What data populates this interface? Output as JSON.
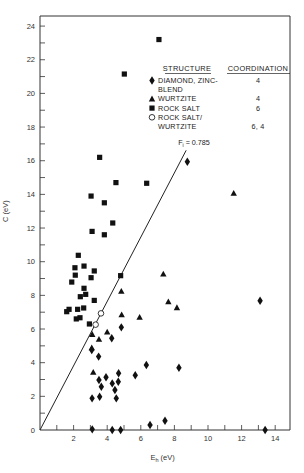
{
  "chart_data": {
    "type": "scatter",
    "title": "",
    "xlabel": "E_h (eV)",
    "ylabel": "C (eV)",
    "xlim": [
      0,
      15
    ],
    "ylim": [
      0,
      24.5
    ],
    "x_ticks": [
      2,
      4,
      6,
      8,
      10,
      12,
      14
    ],
    "x_minor_step": 1,
    "y_ticks": [
      0,
      2,
      4,
      6,
      8,
      10,
      12,
      14,
      16,
      18,
      20,
      22,
      24
    ],
    "y_minor_step": 1,
    "grid": false,
    "legend": {
      "placement": "top-right",
      "header_structure": "STRUCTURE",
      "header_coordination": "COORDINATION",
      "entries": [
        {
          "marker": "diamond",
          "label_lines": [
            "DIAMOND, ZINC-",
            "BLEND"
          ],
          "coordination": "4"
        },
        {
          "marker": "triangle",
          "label_lines": [
            "WURTZITE"
          ],
          "coordination": "4"
        },
        {
          "marker": "square",
          "label_lines": [
            "ROCK SALT"
          ],
          "coordination": "6"
        },
        {
          "marker": "circle",
          "label_lines": [
            "ROCK SALT/",
            "WURTZITE"
          ],
          "coordination": "6, 4"
        }
      ]
    },
    "reference_line": {
      "label": "F",
      "label_sub": "i",
      "label_value": " = 0.785",
      "slope": 1.91,
      "x_end": 8.7
    },
    "series": [
      {
        "name": "Diamond, Zinc-blend",
        "marker": "diamond",
        "points": [
          [
            8.77,
            15.94
          ],
          [
            13.1,
            7.68
          ],
          [
            4.84,
            6.1
          ],
          [
            4.27,
            5.45
          ],
          [
            3.08,
            4.75
          ],
          [
            3.49,
            4.36
          ],
          [
            6.33,
            3.86
          ],
          [
            8.27,
            3.7
          ],
          [
            4.68,
            3.37
          ],
          [
            3.93,
            3.13
          ],
          [
            5.67,
            3.25
          ],
          [
            3.51,
            2.97
          ],
          [
            4.66,
            2.87
          ],
          [
            4.3,
            2.77
          ],
          [
            3.65,
            2.57
          ],
          [
            4.46,
            2.38
          ],
          [
            3.1,
            1.88
          ],
          [
            3.55,
            1.98
          ],
          [
            4.54,
            1.88
          ],
          [
            7.44,
            0.55
          ],
          [
            6.55,
            0.3
          ],
          [
            3.11,
            0.04
          ],
          [
            4.3,
            0.0
          ],
          [
            4.8,
            0.0
          ],
          [
            13.4,
            0.0
          ]
        ]
      },
      {
        "name": "Wurtzite",
        "marker": "triangle",
        "points": [
          [
            11.53,
            14.06
          ],
          [
            7.34,
            9.27
          ],
          [
            4.84,
            8.24
          ],
          [
            7.64,
            7.62
          ],
          [
            8.15,
            7.27
          ],
          [
            4.86,
            6.85
          ],
          [
            5.93,
            6.7
          ],
          [
            4.0,
            5.82
          ],
          [
            3.11,
            5.68
          ],
          [
            3.51,
            5.39
          ],
          [
            3.08,
            4.89
          ],
          [
            3.17,
            3.43
          ]
        ]
      },
      {
        "name": "Rock salt",
        "marker": "square",
        "points": [
          [
            7.08,
            23.2
          ],
          [
            5.02,
            21.15
          ],
          [
            3.55,
            16.2
          ],
          [
            6.35,
            14.66
          ],
          [
            4.52,
            14.7
          ],
          [
            3.04,
            13.9
          ],
          [
            3.83,
            13.5
          ],
          [
            4.33,
            12.3
          ],
          [
            3.1,
            11.8
          ],
          [
            3.83,
            11.6
          ],
          [
            2.28,
            10.38
          ],
          [
            2.08,
            9.64
          ],
          [
            2.62,
            9.74
          ],
          [
            3.23,
            9.45
          ],
          [
            2.1,
            9.2
          ],
          [
            3.04,
            9.05
          ],
          [
            4.8,
            9.17
          ],
          [
            1.89,
            8.79
          ],
          [
            2.62,
            8.42
          ],
          [
            2.72,
            8.06
          ],
          [
            2.4,
            7.92
          ],
          [
            3.23,
            7.7
          ],
          [
            1.73,
            7.17
          ],
          [
            1.59,
            7.03
          ],
          [
            2.24,
            7.17
          ],
          [
            2.6,
            7.25
          ],
          [
            2.16,
            6.6
          ],
          [
            2.38,
            6.67
          ],
          [
            2.94,
            6.3
          ]
        ]
      },
      {
        "name": "Rock salt/Wurtzite",
        "marker": "circle",
        "points": [
          [
            3.63,
            6.93
          ],
          [
            3.31,
            6.26
          ]
        ]
      }
    ]
  }
}
